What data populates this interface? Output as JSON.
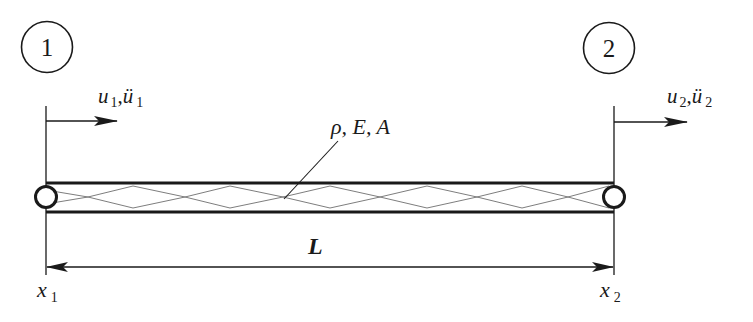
{
  "diagram": {
    "type": "bar-element",
    "colors": {
      "stroke": "#1a1a1a",
      "hatch": "#6e6e6e",
      "background": "#ffffff"
    },
    "nodes": [
      {
        "id": "1",
        "label": "1",
        "displacement_symbol": "u",
        "acceleration_symbol": "ü",
        "subscript": "1",
        "coordinate_symbol": "x",
        "coordinate_subscript": "1"
      },
      {
        "id": "2",
        "label": "2",
        "displacement_symbol": "u",
        "acceleration_symbol": "ü",
        "subscript": "2",
        "coordinate_symbol": "x",
        "coordinate_subscript": "2"
      }
    ],
    "element": {
      "properties_label": "ρ, E, A"
    },
    "dimension": {
      "label": "L"
    }
  }
}
